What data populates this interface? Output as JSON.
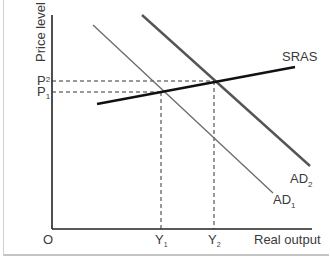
{
  "diagram": {
    "type": "AD-AS shift",
    "y_axis_label": "Price level",
    "x_axis_label": "Real output",
    "origin_label": "O",
    "price_labels": [
      {
        "main": "P",
        "sub": "2"
      },
      {
        "main": "P",
        "sub": "1"
      }
    ],
    "output_labels": [
      {
        "main": "Y",
        "sub": "1"
      },
      {
        "main": "Y",
        "sub": "2"
      }
    ],
    "curves": {
      "sras": {
        "label": "SRAS",
        "color": "#111111"
      },
      "ad1": {
        "main": "AD",
        "sub": "1",
        "color": "#666666"
      },
      "ad2": {
        "main": "AD",
        "sub": "2",
        "color": "#555555"
      }
    },
    "colors": {
      "axis": "#222222",
      "dashed": "#333333",
      "text": "#3a3a3a",
      "frame": "#c8c8c8"
    }
  }
}
